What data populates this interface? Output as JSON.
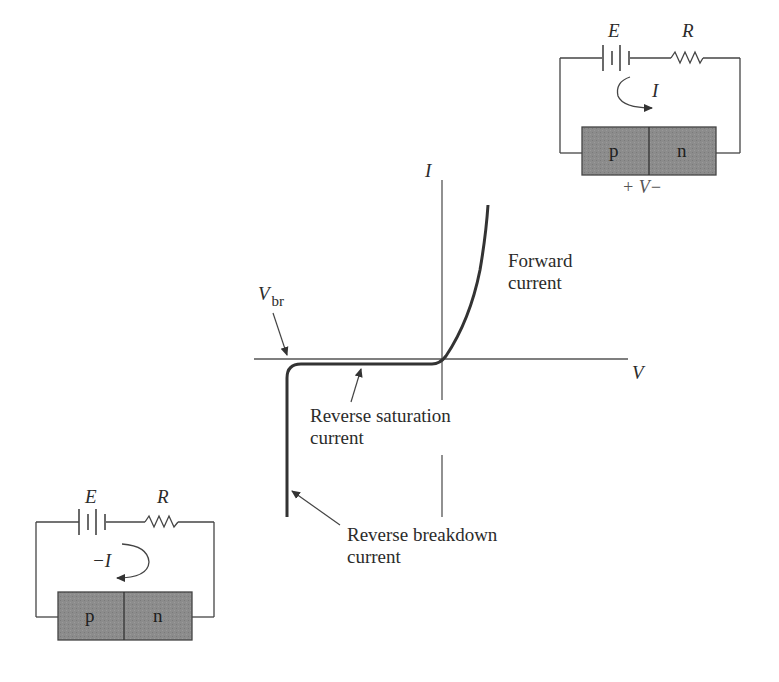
{
  "graph": {
    "y_axis_label": "I",
    "x_axis_label": "V",
    "vbr_label": "V",
    "vbr_subscript": "br",
    "forward_label_line1": "Forward",
    "forward_label_line2": "current",
    "saturation_label_line1": "Reverse saturation",
    "saturation_label_line2": "current",
    "breakdown_label_line1": "Reverse breakdown",
    "breakdown_label_line2": "current"
  },
  "forward_circuit": {
    "battery_label": "E",
    "resistor_label": "R",
    "current_label": "I",
    "p_label": "p",
    "n_label": "n",
    "voltage_label": "+ V−"
  },
  "reverse_circuit": {
    "battery_label": "E",
    "resistor_label": "R",
    "current_label": "−I",
    "p_label": "p",
    "n_label": "n"
  },
  "colors": {
    "line": "#3a3a3a",
    "curve": "#333333",
    "junction_fill": "#8a8a8a",
    "background": "#ffffff"
  }
}
